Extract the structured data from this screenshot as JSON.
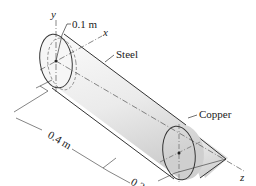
{
  "diagram": {
    "title": "",
    "parts": [
      {
        "name": "Steel",
        "shape": "cylinder"
      },
      {
        "name": "Copper",
        "shape": "cone"
      }
    ],
    "dimensions": {
      "radius": "0.1 m",
      "cylinder_length": "0.4 m",
      "cone_length": "0.3 m"
    },
    "axes": {
      "x": "x",
      "y": "y",
      "z": "z"
    },
    "colors": {
      "outline": "#333333",
      "fill_light": "#f4f4f4",
      "fill_shade": "#d6d6d6"
    }
  }
}
